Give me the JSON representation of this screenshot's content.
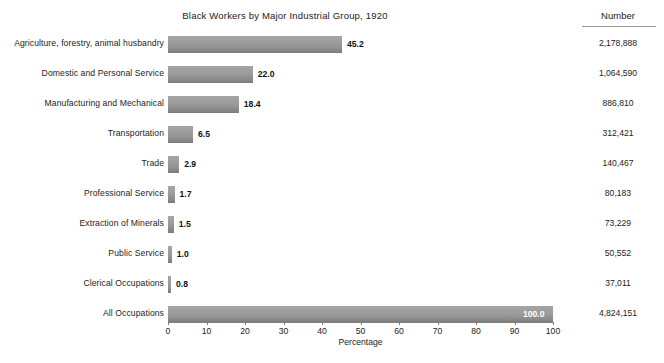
{
  "chart_data": {
    "type": "bar",
    "orientation": "horizontal",
    "title": "Black Workers by Major Industrial Group, 1920",
    "xlabel": "Percentage",
    "ylabel": "",
    "xlim": [
      0,
      100
    ],
    "xticks": [
      0,
      10,
      20,
      30,
      40,
      50,
      60,
      70,
      80,
      90,
      100
    ],
    "grid": false,
    "legend": null,
    "categories": [
      "Agriculture, forestry, animal husbandry",
      "Domestic and Personal Service",
      "Manufacturing and Mechanical",
      "Transportation",
      "Trade",
      "Professional Service",
      "Extraction of Minerals",
      "Public Service",
      "Clerical Occupations",
      "All Occupations"
    ],
    "values": [
      45.2,
      22.0,
      18.4,
      6.5,
      2.9,
      1.7,
      1.5,
      1.0,
      0.8,
      100.0
    ],
    "value_labels": [
      "45.2",
      "22.0",
      "18.4",
      "6.5",
      "2.9",
      "1.7",
      "1.5",
      "1.0",
      "0.8",
      "100.0"
    ],
    "series": [
      {
        "name": "Percentage",
        "values": [
          45.2,
          22.0,
          18.4,
          6.5,
          2.9,
          1.7,
          1.5,
          1.0,
          0.8,
          100.0
        ]
      },
      {
        "name": "Number",
        "values": [
          2178888,
          1064590,
          886810,
          312421,
          140467,
          80183,
          73229,
          50552,
          37011,
          4824151
        ]
      }
    ],
    "bar_color": "#9a9a9a"
  },
  "number_column": {
    "header": "Number",
    "values": [
      "2,178,888",
      "1,064,590",
      "886,810",
      "312,421",
      "140,467",
      "80,183",
      "73,229",
      "50,552",
      "37,011",
      "4,824,151"
    ]
  },
  "rows": [
    {
      "label": "Agriculture, forestry, animal husbandry",
      "value": 45.2,
      "value_label": "45.2",
      "number": "2,178,888"
    },
    {
      "label": "Domestic and Personal Service",
      "value": 22.0,
      "value_label": "22.0",
      "number": "1,064,590"
    },
    {
      "label": "Manufacturing and Mechanical",
      "value": 18.4,
      "value_label": "18.4",
      "number": "886,810"
    },
    {
      "label": "Transportation",
      "value": 6.5,
      "value_label": "6.5",
      "number": "312,421"
    },
    {
      "label": "Trade",
      "value": 2.9,
      "value_label": "2.9",
      "number": "140,467"
    },
    {
      "label": "Professional Service",
      "value": 1.7,
      "value_label": "1.7",
      "number": "80,183"
    },
    {
      "label": "Extraction of Minerals",
      "value": 1.5,
      "value_label": "1.5",
      "number": "73,229"
    },
    {
      "label": "Public Service",
      "value": 1.0,
      "value_label": "1.0",
      "number": "50,552"
    },
    {
      "label": "Clerical Occupations",
      "value": 0.8,
      "value_label": "0.8",
      "number": "37,011"
    },
    {
      "label": "All Occupations",
      "value": 100.0,
      "value_label": "100.0",
      "number": "4,824,151"
    }
  ],
  "axis": {
    "ticks": [
      "0",
      "10",
      "20",
      "30",
      "40",
      "50",
      "60",
      "70",
      "80",
      "90",
      "100"
    ],
    "title": "Percentage"
  },
  "colors": {
    "bar": "#9a9a9a",
    "bar_shadow": "#7b7b7b",
    "text": "#1c1c1c",
    "rule": "#9a9a9a",
    "background": "#ffffff"
  }
}
